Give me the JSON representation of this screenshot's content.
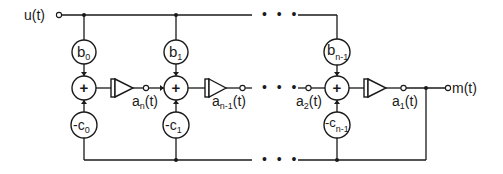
{
  "diagram": {
    "type": "signal-flow block diagram",
    "input": {
      "label": "u(t)"
    },
    "output": {
      "label": "m(t)"
    },
    "ellipsis": "• • •",
    "stages": [
      {
        "b": {
          "base": "b",
          "sub": "0"
        },
        "sum": "+",
        "c": {
          "base": "-c",
          "sub": "0"
        },
        "out_signal": {
          "base": "a",
          "sub": "n",
          "suffix": "(t)"
        }
      },
      {
        "b": {
          "base": "b",
          "sub": "1"
        },
        "sum": "+",
        "c": {
          "base": "-c",
          "sub": "1"
        },
        "in_signal": {
          "base": "a",
          "sub": "n",
          "suffix": "(t)"
        },
        "out_signal": {
          "base": "a",
          "sub": "n-1",
          "suffix": "(t)"
        }
      },
      {
        "b": {
          "base": "b",
          "sub": "n-1"
        },
        "sum": "+",
        "c": {
          "base": "-c",
          "sub": "n-1"
        },
        "in_signal": {
          "base": "a",
          "sub": "2",
          "suffix": "(t)"
        },
        "out_signal": {
          "base": "a",
          "sub": "1",
          "suffix": "(t)"
        }
      }
    ],
    "block_types": [
      "coefficient",
      "summer",
      "integrator"
    ],
    "colors": {
      "stroke": "#1a1a1a",
      "background": "#ffffff"
    }
  }
}
